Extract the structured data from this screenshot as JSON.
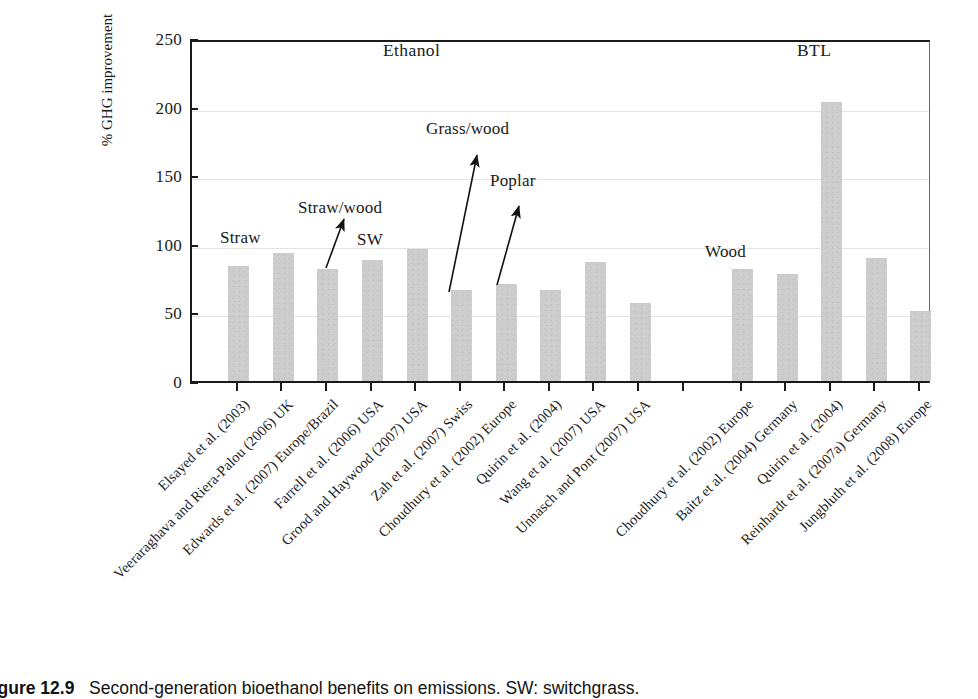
{
  "figure": {
    "caption_number": "Figure 12.9",
    "caption_text": "Second-generation bioethanol benefits on emissions. SW: switchgrass."
  },
  "chart_data": {
    "type": "bar",
    "title": "",
    "xlabel": "",
    "ylabel": "% GHG improvement",
    "ylim": [
      0,
      250
    ],
    "yticks": [
      0,
      50,
      100,
      150,
      200,
      250
    ],
    "ytick_labels": [
      "0",
      "50",
      "100",
      "150",
      "200",
      "250"
    ],
    "grid": true,
    "legend": "none",
    "categories": [
      "Elsayed et al. (2003)",
      "Veeraraghava and Riera-Palou (2006) UK",
      "Edwards et al. (2007) Europe/Brazil",
      "Farrell et al. (2006) USA",
      "Grood and Haywood (2007) USA",
      "Zah et al. (2007) Swiss",
      "Choudhury et al. (2002) Europe",
      "Quirin et al. (2004)",
      "Wang et al. (2007) USA",
      "Unnasch and Pont (2007) USA",
      "Choudhury et al. (2002) Europe",
      "Baitz et al. (2004) Germany",
      "Quirin et al. (2004)",
      "Reinhardt et al. (2007a) Germany",
      "Jungbluth et al. (2008) Europe"
    ],
    "values": [
      84,
      93,
      82,
      88,
      96,
      66,
      71,
      66,
      87,
      57,
      82,
      78,
      203,
      90,
      51
    ],
    "bar_color": "#cdcdcd",
    "groups": [
      {
        "label": "Ethanol",
        "start_index": 0,
        "end_index": 9
      },
      {
        "label": "BTL",
        "start_index": 10,
        "end_index": 14
      }
    ],
    "annotations": [
      {
        "text": "Straw",
        "points_to_index": 0,
        "has_arrow": false
      },
      {
        "text": "Straw/wood",
        "points_to_index": 2,
        "has_arrow": true
      },
      {
        "text": "SW",
        "points_to_index": 3,
        "has_arrow": false
      },
      {
        "text": "Grass/wood",
        "points_to_index": 5,
        "has_arrow": true
      },
      {
        "text": "Poplar",
        "points_to_index": 6,
        "has_arrow": true
      },
      {
        "text": "Wood",
        "points_to_index": 10,
        "has_arrow": false
      }
    ]
  }
}
